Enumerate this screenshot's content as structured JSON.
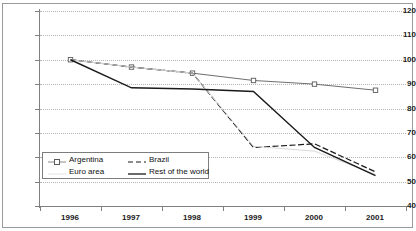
{
  "chart_data": {
    "type": "line",
    "title": "",
    "subtitle": "",
    "xlabel": "",
    "ylabel": "",
    "categories": [
      "1996",
      "1997",
      "1998",
      "1999",
      "2000",
      "2001"
    ],
    "x_tick_labels": [
      "1996",
      "1997",
      "1998",
      "1999",
      "2000",
      "2001"
    ],
    "y_tick_labels": [
      "120",
      "110",
      "100",
      "90",
      "80",
      "70",
      "60",
      "50",
      "40"
    ],
    "ylim": [
      40,
      120
    ],
    "y_step": 10,
    "grid": "horizontal-dotted",
    "legend_position": "inside-lower-left",
    "series": [
      {
        "name": "Argentina",
        "style": "line-with-open-square-markers",
        "color": "#6e6e6e",
        "values": [
          100,
          97,
          94.5,
          91.5,
          90,
          87.5
        ]
      },
      {
        "name": "Brazil",
        "style": "dashed",
        "color": "#1a1a1a",
        "values": [
          100,
          97,
          94.5,
          64,
          65.5,
          54
        ]
      },
      {
        "name": "Euro area",
        "style": "solid-light",
        "color": "#d9d9d9",
        "values": [
          100,
          97,
          94.5,
          64.5,
          62.5,
          53
        ]
      },
      {
        "name": "Rest of the world",
        "style": "solid",
        "color": "#1a1a1a",
        "values": [
          100,
          88.5,
          88,
          87,
          64,
          52.5
        ]
      }
    ],
    "legend": [
      {
        "label": "Argentina",
        "swatch": "line-markers-gray"
      },
      {
        "label": "Brazil",
        "swatch": "dashed-black"
      },
      {
        "label": "Euro area",
        "swatch": "solid-light"
      },
      {
        "label": "Rest of the world",
        "swatch": "solid-black"
      }
    ]
  }
}
